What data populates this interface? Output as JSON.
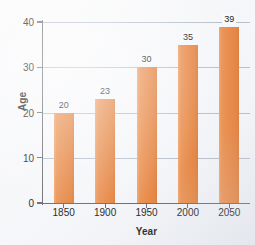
{
  "chart_data": {
    "type": "bar",
    "title": "",
    "xlabel": "Year",
    "ylabel": "Age",
    "categories": [
      "1850",
      "1900",
      "1950",
      "2000",
      "2050"
    ],
    "values": [
      20,
      23,
      30,
      35,
      39
    ],
    "data_labels": [
      "20",
      "23",
      "30",
      "35",
      "39"
    ],
    "ylim": [
      0,
      40
    ],
    "yticks": [
      0,
      10,
      20,
      30,
      40
    ],
    "ytick_labels": [
      "0",
      "10",
      "20",
      "30",
      "40"
    ],
    "grid": "horizontal",
    "legend": "none",
    "series": [
      {
        "name": "Age",
        "values": [
          20,
          23,
          30,
          35,
          39
        ]
      }
    ],
    "colors": {
      "bar": "#E88D4D",
      "bar_light": "#F0A772",
      "bar_dark": "#DD7F40",
      "gridline": "#B9C0CC",
      "axis": "#6D6F74",
      "text": "#2B2B2B",
      "background": "#F7F8FA"
    }
  }
}
